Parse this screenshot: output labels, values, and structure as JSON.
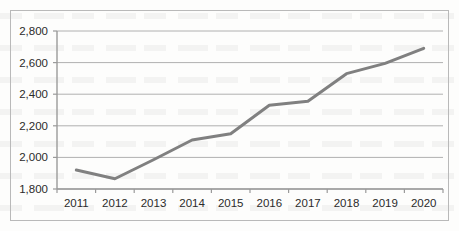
{
  "chart_data": {
    "type": "line",
    "title": "",
    "subtitle": "",
    "xlabel": "",
    "ylabel": "",
    "categories": [
      "2011",
      "2012",
      "2013",
      "2014",
      "2015",
      "2016",
      "2017",
      "2018",
      "2019",
      "2020"
    ],
    "values": [
      1920,
      1865,
      1985,
      2110,
      2150,
      2330,
      2355,
      2530,
      2595,
      2690
    ],
    "series": [
      {
        "name": "",
        "values": [
          1920,
          1865,
          1985,
          2110,
          2150,
          2330,
          2355,
          2530,
          2595,
          2690
        ]
      }
    ],
    "ylim": [
      1800,
      2800
    ],
    "y_ticks": [
      1800,
      2000,
      2200,
      2400,
      2600,
      2800
    ],
    "y_tick_labels": [
      "1,800",
      "2,000",
      "2,200",
      "2,400",
      "2,600",
      "2,800"
    ],
    "x_tick_labels": [
      "2011",
      "2012",
      "2013",
      "2014",
      "2015",
      "2016",
      "2017",
      "2018",
      "2019",
      "2020"
    ],
    "grid": true,
    "grid_axis": "y",
    "legend": false,
    "legend_position": "none",
    "annotations": [],
    "line_color": "#808080",
    "line_width": 3,
    "markers": false,
    "grid_color": "#b0b0b0",
    "axis_color": "#9a9a9a",
    "frame_color": "#b9b9b9",
    "plot_background": "#ffffff",
    "tick_label_color": "#2b2b2b"
  }
}
